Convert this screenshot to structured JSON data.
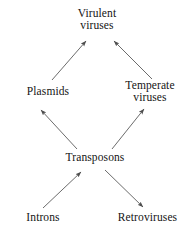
{
  "diagram": {
    "type": "directed-graph",
    "background_color": "#ffffff",
    "text_color": "#141414",
    "arrow_color": "#5a5a5a",
    "nodes": [
      {
        "id": "virulent-viruses",
        "label": "Virulent viruses",
        "line1": "Virulent",
        "line2": "viruses",
        "x": 97,
        "y": 21
      },
      {
        "id": "plasmids",
        "label": "Plasmids",
        "line1": "Plasmids",
        "line2": "",
        "x": 48,
        "y": 95
      },
      {
        "id": "temperate-viruses",
        "label": "Temperate viruses",
        "line1": "Temperate",
        "line2": "viruses",
        "x": 150,
        "y": 93
      },
      {
        "id": "transposons",
        "label": "Transposons",
        "line1": "Transposons",
        "line2": "",
        "x": 95,
        "y": 161
      },
      {
        "id": "introns",
        "label": "Introns",
        "line1": "Introns",
        "line2": "",
        "x": 43,
        "y": 221
      },
      {
        "id": "retroviruses",
        "label": "Retroviruses",
        "line1": "Retroviruses",
        "line2": "",
        "x": 147,
        "y": 221
      }
    ],
    "edges": [
      {
        "id": "plasmids-to-virulent",
        "from": "plasmids",
        "to": "virulent-viruses",
        "x1": 52,
        "y1": 80,
        "x2": 86,
        "y2": 41
      },
      {
        "id": "temperate-to-virulent",
        "from": "temperate-viruses",
        "to": "virulent-viruses",
        "x1": 152,
        "y1": 79,
        "x2": 114,
        "y2": 41
      },
      {
        "id": "transposons-to-plasmids",
        "from": "transposons",
        "to": "plasmids",
        "x1": 77,
        "y1": 149,
        "x2": 41,
        "y2": 110
      },
      {
        "id": "transposons-to-temperate",
        "from": "transposons",
        "to": "temperate-viruses",
        "x1": 112,
        "y1": 149,
        "x2": 144,
        "y2": 109
      },
      {
        "id": "introns-to-transposons",
        "from": "introns",
        "to": "transposons",
        "x1": 43,
        "y1": 208,
        "x2": 81,
        "y2": 172
      },
      {
        "id": "transposons-to-retroviruses",
        "from": "transposons",
        "to": "retroviruses",
        "x1": 105,
        "y1": 170,
        "x2": 143,
        "y2": 207
      }
    ]
  }
}
